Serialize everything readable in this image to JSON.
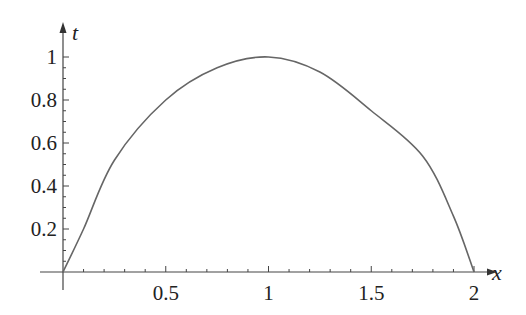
{
  "chart_data": {
    "type": "line",
    "title": "",
    "xlabel": "x",
    "ylabel": "t",
    "xlim": [
      0,
      2
    ],
    "ylim": [
      0,
      1
    ],
    "grid": false,
    "legend": null,
    "x_ticks": [
      {
        "value": 0.5,
        "label": "0.5"
      },
      {
        "value": 1,
        "label": "1"
      },
      {
        "value": 1.5,
        "label": "1.5"
      },
      {
        "value": 2,
        "label": "2"
      }
    ],
    "y_ticks": [
      {
        "value": 0.2,
        "label": "0.2"
      },
      {
        "value": 0.4,
        "label": "0.4"
      },
      {
        "value": 0.6,
        "label": "0.6"
      },
      {
        "value": 0.8,
        "label": "0.8"
      },
      {
        "value": 1,
        "label": "1"
      }
    ],
    "series": [
      {
        "name": "t(x)",
        "color": "#666666",
        "x": [
          0,
          0.1,
          0.25,
          0.5,
          0.75,
          1.0,
          1.25,
          1.5,
          1.75,
          1.9,
          2.0
        ],
        "values": [
          0,
          0.2,
          0.52,
          0.8,
          0.95,
          1.0,
          0.93,
          0.75,
          0.54,
          0.26,
          0
        ]
      }
    ]
  },
  "layout": {
    "origin_px": [
      63,
      272
    ],
    "x_px_per_unit": 205.5,
    "y_px_per_unit": 215
  }
}
